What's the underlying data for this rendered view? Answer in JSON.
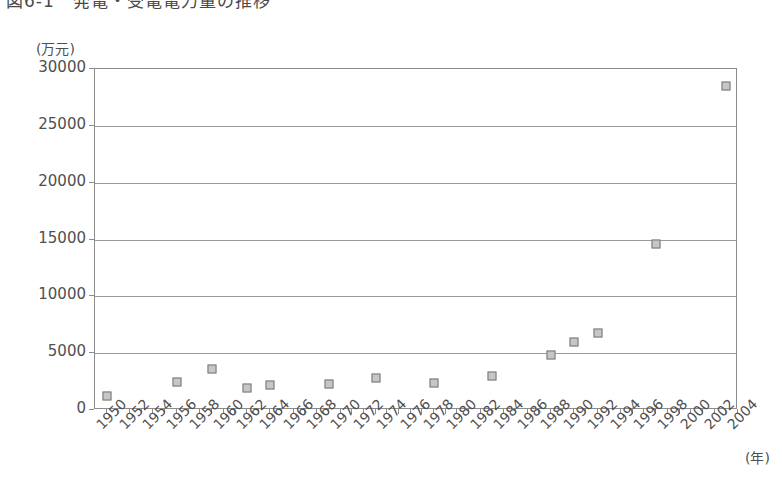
{
  "figure": {
    "title": "図6-1　発電・受電電力量の推移",
    "title_note": "clipped at top edge of screenshot"
  },
  "chart_data": {
    "type": "scatter",
    "title": "図6-1　発電・受電電力量の推移",
    "xlabel": "(年)",
    "ylabel": "(万元)",
    "xlim": [
      1949,
      2004
    ],
    "ylim": [
      0,
      30000
    ],
    "grid": true,
    "legend": "none",
    "marker": {
      "shape": "square",
      "fill": "#c6c6c6",
      "edge": "#777777",
      "size_px": 9
    },
    "y_ticks": [
      0,
      5000,
      10000,
      15000,
      20000,
      25000,
      30000
    ],
    "y_tick_labels": [
      "0",
      "5000",
      "10000",
      "15000",
      "20000",
      "25000",
      "30000"
    ],
    "x_ticks": [
      1950,
      1952,
      1954,
      1956,
      1958,
      1960,
      1962,
      1964,
      1966,
      1968,
      1970,
      1972,
      1974,
      1976,
      1978,
      1980,
      1982,
      1984,
      1986,
      1988,
      1990,
      1992,
      1994,
      1996,
      1998,
      2000,
      2002,
      2004
    ],
    "x_tick_labels": [
      "1950",
      "1952",
      "1954",
      "1956",
      "1958",
      "1960",
      "1962",
      "1964",
      "1966",
      "1968",
      "1970",
      "1972",
      "1974",
      "1976",
      "1978",
      "1980",
      "1982",
      "1984",
      "1986",
      "1988",
      "1990",
      "1992",
      "1994",
      "1996",
      "1998",
      "2000",
      "2002",
      "2004"
    ],
    "x_minor_tick_interval": 1,
    "points": [
      {
        "x": 1950,
        "y": 1200
      },
      {
        "x": 1956,
        "y": 2500
      },
      {
        "x": 1959,
        "y": 3600
      },
      {
        "x": 1962,
        "y": 1950
      },
      {
        "x": 1964,
        "y": 2200
      },
      {
        "x": 1969,
        "y": 2250
      },
      {
        "x": 1973,
        "y": 2800
      },
      {
        "x": 1978,
        "y": 2400
      },
      {
        "x": 1983,
        "y": 2950
      },
      {
        "x": 1988,
        "y": 4800
      },
      {
        "x": 1990,
        "y": 6000
      },
      {
        "x": 1992,
        "y": 6800
      },
      {
        "x": 1997,
        "y": 14600
      },
      {
        "x": 2003,
        "y": 28500
      }
    ]
  },
  "colors": {
    "axis": "#8c8c8c",
    "gridline": "#9a9a9a",
    "text": "#4f4f4f",
    "marker_fill": "#c6c6c6",
    "marker_edge": "#777777",
    "background": "#ffffff"
  }
}
